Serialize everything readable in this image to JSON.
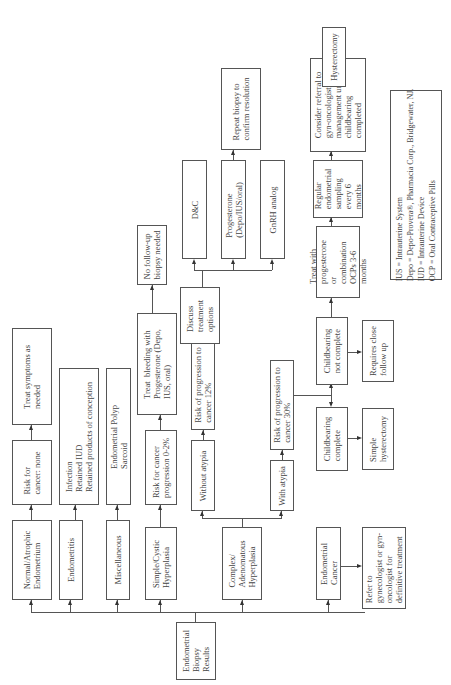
{
  "root": {
    "label": "Endometrial\nBiopsy\nResults"
  },
  "categories": [
    {
      "id": "normal",
      "label": "Normal/Atrophic\nEndometrium"
    },
    {
      "id": "endometritis",
      "label": "Endometritis"
    },
    {
      "id": "misc",
      "label": "Miscellaneous"
    },
    {
      "id": "simple",
      "label": "Simple/Cystic\nHyperplasia"
    },
    {
      "id": "complex",
      "label": "Complex/\nAdenomatous\nHyperplasia"
    },
    {
      "id": "cancer",
      "label": "Endometrial\nCancer"
    }
  ],
  "normal_path": {
    "risk": "Risk for\ncancer: none",
    "action": "Treat symptoms as\nneeded"
  },
  "endometritis_path": {
    "causes": "Infection\nRetained IUD\nRetained products of conception"
  },
  "misc_path": {
    "items": "Endometrial Polyp\nSarcoid"
  },
  "simple_path": {
    "risk": "Risk for cancer\nprogression 0-2%",
    "treat": "Treat  bleeding with\nProgesterone (Depo,\nIUS, oral)",
    "followup": "No follow-up\nbiopsy needed"
  },
  "complex_path": {
    "without_atypia": "Without atypia",
    "without_risk": "Risk of progression to\ncancer 12%",
    "discuss": "Discuss\ntreatment\noptions",
    "options": [
      "D&C",
      "Progesterone\n(Depo/IUS/oral)",
      "GnRH analog"
    ],
    "repeat": "Repeat biopsy to\nconfirm resolution",
    "with_atypia": "With atypia",
    "with_risk": "Risk of progression to\ncancer 30%",
    "childbearing_not_complete": "Childbearing\nnot complete",
    "requires_followup": "Requires close\nfollow up",
    "childbearing_complete": "Childbearing\ncomplete",
    "simple_hysterectomy": "Simple\nhysterectomy",
    "treat_progesterone": "Treat with\nprogesterone\nor\ncombination\nOCPs 3-6\nmonths",
    "regular_sampling": "Regular\nendometrial\nsampling\nevery 6\nmonths",
    "referral": "Consider referral to\ngyn-oncologist for\nmanagement until\nchildbearing\ncompleted",
    "hysterectomy": "Hysterectomy"
  },
  "cancer_path": {
    "refer": "Refer to\ngynecologist or gyn-\noncologist for\ndefinitive treatment"
  },
  "legend": {
    "text": "IUS = Intrauterine System\nDepo = Depo-Provera®, Pharmacia Corp., Bridgewater, NJ.\nIUD = Intrauterine Device\nOCP = Oral Contraceptive Pills"
  }
}
